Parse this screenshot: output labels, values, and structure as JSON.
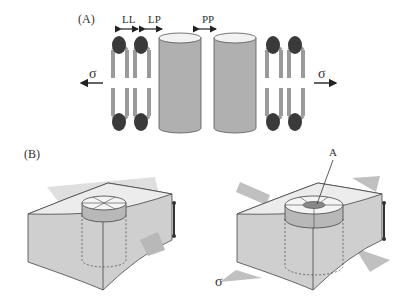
{
  "panel_a": {
    "label": "(A)",
    "spacing_labels": {
      "ll": "LL",
      "lp": "LP",
      "pp": "PP"
    },
    "stress_left": "σ",
    "stress_right": "σ"
  },
  "panel_b": {
    "label": "(B)",
    "annotation": "A",
    "stress": "σ"
  },
  "colors": {
    "lipid_head": "#3a3a3a",
    "lipid_tail": "#9a9a9a",
    "protein_body": "#b0b0b0",
    "protein_top": "#f2f2f2",
    "membrane_top": "#ececec",
    "membrane_side": "#c8c8c8",
    "arrow_gray": "#c0c0c0"
  }
}
